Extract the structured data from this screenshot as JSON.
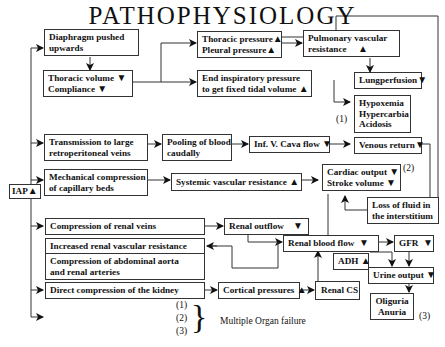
{
  "title": "PATHOPHYSIOLOGY",
  "source": "IAP",
  "up": "▲",
  "down": "▼",
  "nodes": {
    "diaphragm": "Diaphragm pushed upwards",
    "diaphragm_l1": "Diaphragm  pushed",
    "diaphragm_l2": "upwards",
    "thoracic_volume_l1": "Thoracic volume",
    "thoracic_volume_l2": "Compliance",
    "thoracic_pressure_l1": "Thoracic pressure",
    "thoracic_pressure_l2": "Pleural pressure",
    "end_insp_l1": "End inspiratory pressure",
    "end_insp_l2": "to get fixed tidal volume",
    "pulm_vasc_l1": "Pulmonary  vascular",
    "pulm_vasc_l2": "resistance",
    "lungperfusion": "Lungperfusion",
    "hypo_l1": "Hypoxemia",
    "hypo_l2": "Hypercarbia",
    "hypo_l3": "Acidosis",
    "transmission_l1": "Transmission to large",
    "transmission_l2": "retroperitoneal veins",
    "pooling_l1": "Pooling of blood",
    "pooling_l2": "caudally",
    "ivc": "Inf.  V.  Cava flow",
    "venous_return": "Venous return",
    "mech_l1": "Mechanical compression",
    "mech_l2": " of capillary  beds",
    "svr": "Systemic  vascular resistance",
    "cardiac_l1": "Cardiac output",
    "cardiac_l2": "Stroke volume",
    "loss_l1": "Loss of fluid in",
    "loss_l2": "the interstitium",
    "comp_renal_veins": "Compression of renal  veins",
    "renal_outflow": "Renal  outflow",
    "incr_renal_vasc": "Increased renal vascular resistance",
    "comp_aorta_l1": "Compression of abdominal aorta",
    "comp_aorta_l2": "and renal arteries",
    "renal_blood_flow": "Renal  blood flow",
    "gfr": "GFR",
    "adh": "ADH",
    "urine_output": "Urine output",
    "direct_comp": "Direct compression of the kidney",
    "cortical": "Cortical pressures",
    "renal_cs": "Renal CS",
    "oliguria_l1": "Oliguria",
    "oliguria_l2": "Anuria"
  },
  "markers": {
    "m1": "(1)",
    "m2": "(2)",
    "m3": "(3)"
  },
  "legend": {
    "items": [
      "(1)",
      "(2)",
      "(3)"
    ],
    "brace": "}",
    "label": "Multiple Organ failure"
  }
}
